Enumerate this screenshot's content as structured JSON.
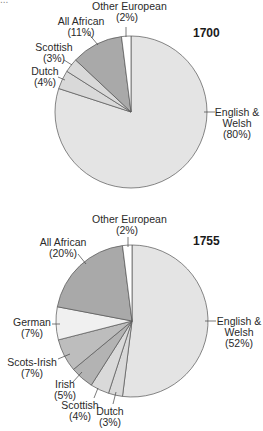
{
  "header_fragment": "...",
  "chart_data": [
    {
      "type": "pie",
      "title": "1700",
      "colors": [
        "#e4e4e4",
        "#d9d9d9",
        "#d9d9d9",
        "#a9a9a9",
        "#ffffff"
      ],
      "slices": [
        {
          "label": "English & Welsh",
          "value": 80,
          "display": "(80%)"
        },
        {
          "label": "Dutch",
          "value": 4,
          "display": "(4%)"
        },
        {
          "label": "Scottish",
          "value": 3,
          "display": "(3%)"
        },
        {
          "label": "All African",
          "value": 11,
          "display": "(11%)"
        },
        {
          "label": "Other European",
          "value": 2,
          "display": "(2%)"
        }
      ]
    },
    {
      "type": "pie",
      "title": "1755",
      "colors": [
        "#e4e4e4",
        "#d9d9d9",
        "#d9d9d9",
        "#b3b3b3",
        "#bdbdbd",
        "#f0f0f0",
        "#a9a9a9",
        "#ffffff"
      ],
      "slices": [
        {
          "label": "English & Welsh",
          "value": 52,
          "display": "(52%)"
        },
        {
          "label": "Dutch",
          "value": 3,
          "display": "(3%)"
        },
        {
          "label": "Scottish",
          "value": 4,
          "display": "(4%)"
        },
        {
          "label": "Irish",
          "value": 5,
          "display": "(5%)"
        },
        {
          "label": "Scots-Irish",
          "value": 7,
          "display": "(7%)"
        },
        {
          "label": "German",
          "value": 7,
          "display": "(7%)"
        },
        {
          "label": "All African",
          "value": 20,
          "display": "(20%)"
        },
        {
          "label": "Other European",
          "value": 2,
          "display": "(2%)"
        }
      ]
    }
  ],
  "labels": {
    "p1": {
      "year": "1700",
      "english_a": "English &",
      "english_b": "Welsh",
      "english_c": "(80%)",
      "dutch_a": "Dutch",
      "dutch_b": "(4%)",
      "scottish_a": "Scottish",
      "scottish_b": "(3%)",
      "african_a": "All African",
      "african_b": "(11%)",
      "other_a": "Other European",
      "other_b": "(2%)"
    },
    "p2": {
      "year": "1755",
      "english_a": "English &",
      "english_b": "Welsh",
      "english_c": "(52%)",
      "dutch_a": "Dutch",
      "dutch_b": "(3%)",
      "scottish_a": "Scottish",
      "scottish_b": "(4%)",
      "irish_a": "Irish",
      "irish_b": "(5%)",
      "scotsirish_a": "Scots-Irish",
      "scotsirish_b": "(7%)",
      "german_a": "German",
      "german_b": "(7%)",
      "african_a": "All African",
      "african_b": "(20%)",
      "other_a": "Other European",
      "other_b": "(2%)"
    }
  }
}
